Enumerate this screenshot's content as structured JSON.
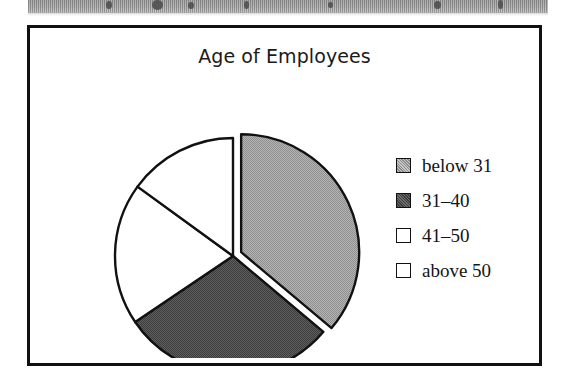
{
  "page": {
    "background": "#ffffff",
    "scan_band": {
      "name": "scan-artifact-band",
      "color": "#c4c4c4"
    }
  },
  "chart_frame": {
    "border_color": "#111111"
  },
  "chart_data": {
    "type": "pie",
    "title": "Age of Employees",
    "xlabel": "",
    "ylabel": "",
    "categories": [
      "below 31",
      "31–40",
      "41–50",
      "above 50"
    ],
    "values": [
      36.1,
      29.4,
      19.4,
      15.1
    ],
    "units": "percent",
    "start_angle_deg": 0,
    "direction": "clockwise",
    "slices": [
      {
        "label": "below 31",
        "value": 36.1,
        "start_angle_deg": 0,
        "end_angle_deg": 130,
        "color": "#a9a9a9",
        "fill": "light-gray-halftone",
        "exploded": true,
        "explode_offset_px": 9
      },
      {
        "label": "31–40",
        "value": 29.4,
        "start_angle_deg": 130,
        "end_angle_deg": 236,
        "color": "#585858",
        "fill": "dark-gray-halftone",
        "exploded": false,
        "explode_offset_px": 0
      },
      {
        "label": "41–50",
        "value": 19.4,
        "start_angle_deg": 236,
        "end_angle_deg": 306,
        "color": "#ffffff",
        "fill": "white",
        "exploded": false,
        "explode_offset_px": 0
      },
      {
        "label": "above 50",
        "value": 15.1,
        "start_angle_deg": 306,
        "end_angle_deg": 360,
        "color": "#ffffff",
        "fill": "white",
        "exploded": false,
        "explode_offset_px": 0
      }
    ],
    "legend": {
      "position": "right",
      "entries": [
        {
          "label": "below 31",
          "color": "#a9a9a9",
          "fill": "light-gray-halftone"
        },
        {
          "label": "31–40",
          "color": "#585858",
          "fill": "dark-gray-halftone"
        },
        {
          "label": "41–50",
          "color": "#ffffff",
          "fill": "white"
        },
        {
          "label": "above 50",
          "color": "#ffffff",
          "fill": "white"
        }
      ]
    },
    "grid": false
  }
}
